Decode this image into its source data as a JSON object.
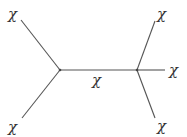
{
  "diagram": {
    "type": "feynman-diagram",
    "line_color": "#555555",
    "text_color": "#333333",
    "vertices": [
      {
        "id": "left",
        "x": 60,
        "y": 70
      },
      {
        "id": "right",
        "x": 137,
        "y": 70
      }
    ],
    "labels": {
      "top_left": "χ",
      "bottom_left": "χ",
      "propagator": "χ",
      "top_right": "χ",
      "middle_right": "χ",
      "bottom_right": "χ"
    }
  }
}
